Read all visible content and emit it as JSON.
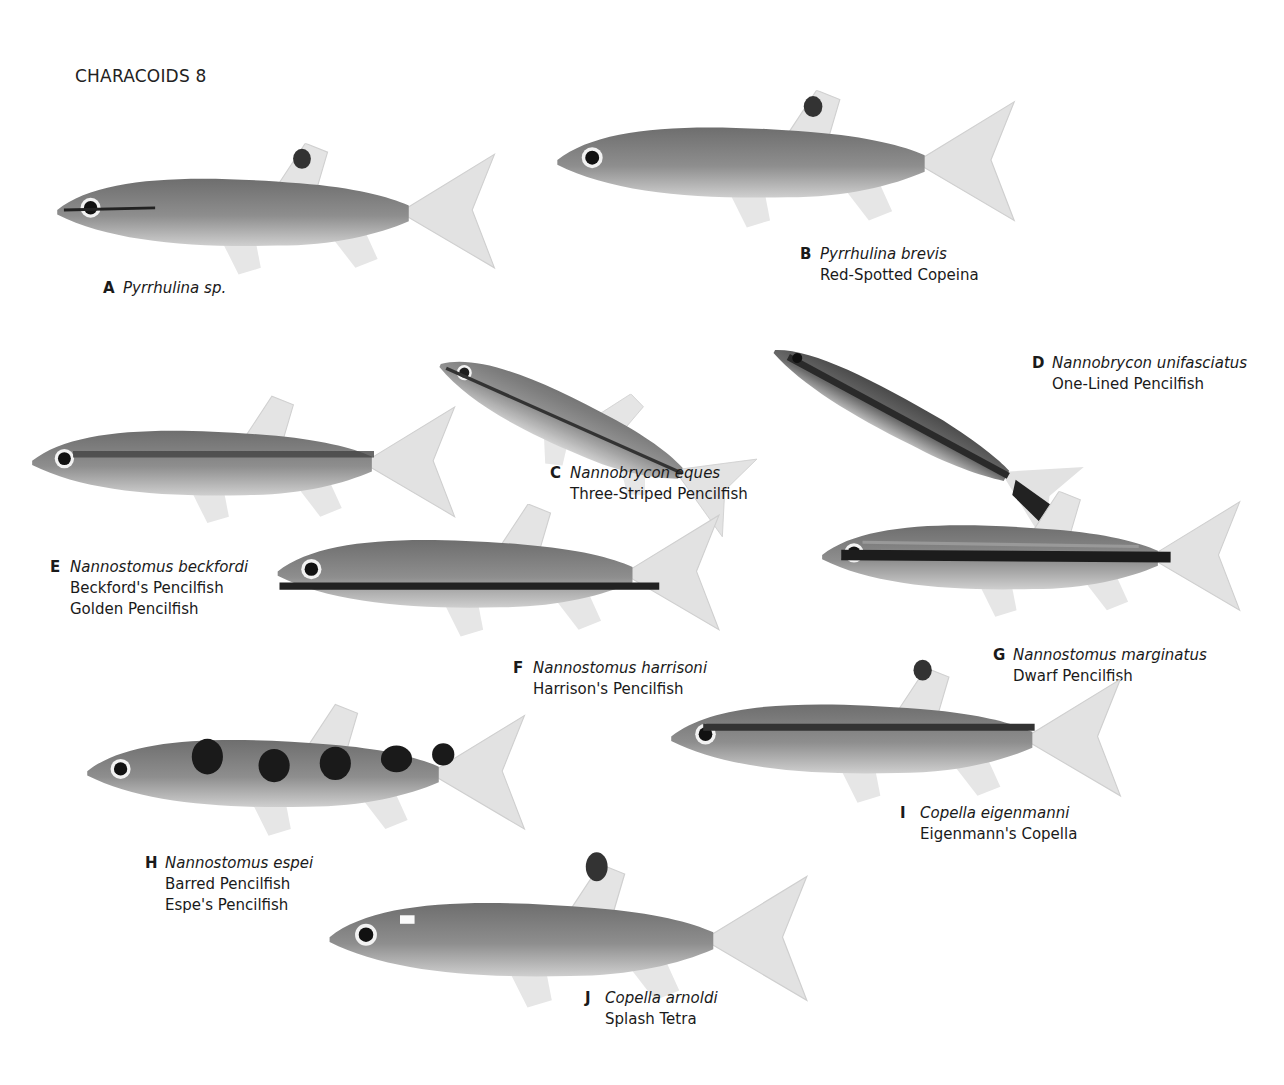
{
  "page": {
    "title": "CHARACOIDS 8"
  },
  "species": [
    {
      "letter": "A",
      "scientific": "Pyrrhulina sp.",
      "common": []
    },
    {
      "letter": "B",
      "scientific": "Pyrrhulina brevis",
      "common": [
        "Red-Spotted Copeina"
      ]
    },
    {
      "letter": "C",
      "scientific": "Nannobrycon eques",
      "common": [
        "Three-Striped Pencilfish"
      ]
    },
    {
      "letter": "D",
      "scientific": "Nannobrycon unifasciatus",
      "common": [
        "One-Lined Pencilfish"
      ]
    },
    {
      "letter": "E",
      "scientific": "Nannostomus beckfordi",
      "common": [
        "Beckford's Pencilfish",
        "Golden Pencilfish"
      ]
    },
    {
      "letter": "F",
      "scientific": "Nannostomus harrisoni",
      "common": [
        "Harrison's Pencilfish"
      ]
    },
    {
      "letter": "G",
      "scientific": "Nannostomus marginatus",
      "common": [
        "Dwarf Pencilfish"
      ]
    },
    {
      "letter": "H",
      "scientific": "Nannostomus espei",
      "common": [
        "Barred Pencilfish",
        "Espe's Pencilfish"
      ]
    },
    {
      "letter": "I",
      "scientific": "Copella eigenmanni",
      "common": [
        "Eigenmann's Copella"
      ]
    },
    {
      "letter": "J",
      "scientific": "Copella arnoldi",
      "common": [
        "Splash Tetra"
      ]
    }
  ]
}
